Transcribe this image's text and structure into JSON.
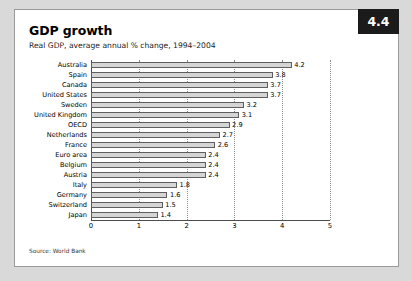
{
  "badge": {
    "number": "4.4"
  },
  "header": {
    "title": "GDP growth",
    "subtitle": "Real GDP, average annual % change, 1994–2004"
  },
  "source": {
    "text": "Source: World Bank"
  },
  "colors": {
    "page_background": "#d9d9d9",
    "card_background": "#ffffff",
    "badge_background": "#1b1b1b",
    "badge_text": "#ffffff",
    "bar_fill": "#d5d5d5",
    "bar_border": "#5e5e5e",
    "gridline": "#8d8d8d",
    "axis": "#4d4d4d"
  },
  "chart_data": {
    "type": "bar",
    "orientation": "horizontal",
    "title": "GDP growth",
    "subtitle": "Real GDP, average annual % change, 1994–2004",
    "xlabel": "",
    "ylabel": "",
    "xlim": [
      0,
      5
    ],
    "xticks": [
      "0",
      "1",
      "2",
      "3",
      "4",
      "5"
    ],
    "grid": true,
    "legend": false,
    "source": "Source: World Bank",
    "categories": [
      "Australia",
      "Spain",
      "Canada",
      "United States",
      "Sweden",
      "United Kingdom",
      "OECD",
      "Netherlands",
      "France",
      "Euro area",
      "Belgium",
      "Austria",
      "Italy",
      "Germany",
      "Switzerland",
      "Japan"
    ],
    "values": [
      4.2,
      3.8,
      3.7,
      3.7,
      3.2,
      3.1,
      2.9,
      2.7,
      2.6,
      2.4,
      2.4,
      2.4,
      1.8,
      1.6,
      1.5,
      1.4
    ],
    "value_labels": [
      "4.2",
      "3.8",
      "3.7",
      "3.7",
      "3.2",
      "3.1",
      "2.9",
      "2.7",
      "2.6",
      "2.4",
      "2.4",
      "2.4",
      "1.8",
      "1.6",
      "1.5",
      "1.4"
    ]
  }
}
